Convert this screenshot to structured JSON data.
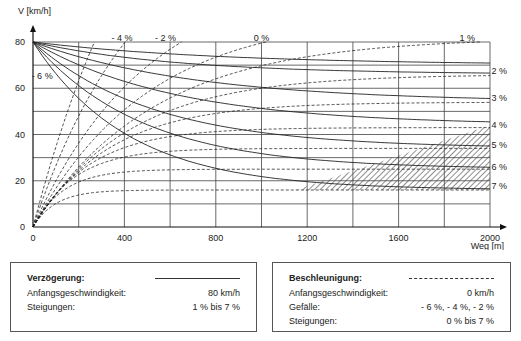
{
  "chart_data": {
    "type": "line",
    "title": "",
    "ylabel": "V [km/h]",
    "xlabel": "Weg [m]",
    "xlim": [
      0,
      2000
    ],
    "ylim": [
      0,
      80
    ],
    "xticks": [
      0,
      400,
      800,
      1200,
      1600,
      2000
    ],
    "yticks": [
      0,
      20,
      40,
      60,
      80
    ],
    "x_grid_step": 200,
    "y_grid_step": 10,
    "grid": true,
    "deceleration_series": {
      "style": "solid",
      "initial_speed": 80,
      "series": [
        {
          "name": "1 %",
          "terminal": 70,
          "k": 0.0012
        },
        {
          "name": "2 %",
          "terminal": 66,
          "k": 0.0016
        },
        {
          "name": "3 %",
          "terminal": 54,
          "k": 0.0014
        },
        {
          "name": "4 %",
          "terminal": 44,
          "k": 0.0016
        },
        {
          "name": "5 %",
          "terminal": 34,
          "k": 0.0019
        },
        {
          "name": "6 %",
          "terminal": 25,
          "k": 0.0021
        },
        {
          "name": "7 %",
          "terminal": 16,
          "k": 0.0024
        }
      ]
    },
    "acceleration_series": {
      "style": "dashed",
      "initial_speed": 0,
      "series": [
        {
          "name": "- 6 %",
          "terminal": 200,
          "k": 0.0019
        },
        {
          "name": "- 4 %",
          "terminal": 140,
          "k": 0.0021
        },
        {
          "name": "- 2 %",
          "terminal": 110,
          "k": 0.002
        },
        {
          "name": "0 %",
          "terminal": 92,
          "k": 0.002
        },
        {
          "name": "1 %",
          "terminal": 82,
          "k": 0.0019
        },
        {
          "name": "2 %",
          "terminal": 66,
          "k": 0.0024
        },
        {
          "name": "3 %",
          "terminal": 54,
          "k": 0.003
        },
        {
          "name": "4 %",
          "terminal": 43,
          "k": 0.004
        },
        {
          "name": "5 %",
          "terminal": 34,
          "k": 0.0055
        },
        {
          "name": "6 %",
          "terminal": 25,
          "k": 0.0075
        },
        {
          "name": "7 %",
          "terminal": 16,
          "k": 0.01
        }
      ]
    },
    "hatched_region": {
      "description": "area between 7% deceleration and acceleration curves beyond ~1150 m",
      "polygon": [
        [
          1150,
          16
        ],
        [
          2000,
          16
        ],
        [
          2000,
          44
        ]
      ]
    },
    "series_labels": [
      {
        "text": "- 6 %",
        "x": 40,
        "y": 64
      },
      {
        "text": "- 4 %",
        "x": 390,
        "y": 80.5
      },
      {
        "text": "- 2 %",
        "x": 580,
        "y": 80.5
      },
      {
        "text": "0 %",
        "x": 1000,
        "y": 80.5
      },
      {
        "text": "1 %",
        "x": 1900,
        "y": 80.5
      },
      {
        "text": "2 %",
        "x": 2040,
        "y": 66
      },
      {
        "text": "3 %",
        "x": 2040,
        "y": 54.5
      },
      {
        "text": "4 %",
        "x": 2040,
        "y": 43
      },
      {
        "text": "5 %",
        "x": 2040,
        "y": 34
      },
      {
        "text": "6 %",
        "x": 2040,
        "y": 24.5
      },
      {
        "text": "7 %",
        "x": 2040,
        "y": 16.5
      }
    ]
  },
  "legend": {
    "deceleration": {
      "title": "Verzögerung:",
      "rows": [
        {
          "label": "Anfangsgeschwindigkeit:",
          "value": "80 km/h"
        },
        {
          "label": "Steigungen:",
          "value": "1 % bis 7 %"
        }
      ]
    },
    "acceleration": {
      "title": "Beschleunigung:",
      "rows": [
        {
          "label": "Anfangsgeschwindigkeit:",
          "value": "0 km/h"
        },
        {
          "label": "Gefälle:",
          "value": "- 6 %, - 4 %, - 2 %"
        },
        {
          "label": "Steigungen:",
          "value": "0 % bis 7 %"
        }
      ]
    }
  }
}
